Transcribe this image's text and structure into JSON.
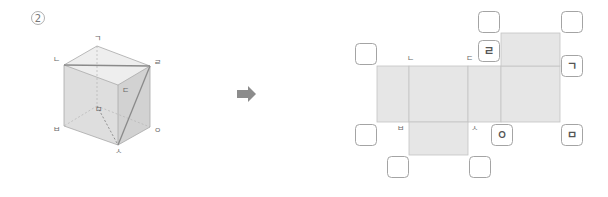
{
  "problem": {
    "number_label": "2"
  },
  "colors": {
    "top_face": "#eeeeee",
    "front_face": "#dedede",
    "right_face": "#d2d2d2",
    "edge": "#a8a8a8",
    "diag": "#8a8a8a",
    "net_fill": "#e6e6e6",
    "net_line": "#c4c4c4",
    "box_border": "#9a9a9a",
    "arrow": "#8c8c8c"
  },
  "cube": {
    "vertices": {
      "g": {
        "label": "ㄱ",
        "x": 97,
        "y": 46
      },
      "n": {
        "label": "ㄴ",
        "x": 64,
        "y": 65
      },
      "r": {
        "label": "ㄹ",
        "x": 150,
        "y": 66
      },
      "d": {
        "label": "ㄷ",
        "x": 118,
        "y": 85
      },
      "m": {
        "label": "ㅁ",
        "x": 97,
        "y": 106
      },
      "b": {
        "label": "ㅂ",
        "x": 64,
        "y": 126
      },
      "o": {
        "label": "ㅇ",
        "x": 150,
        "y": 127
      },
      "s": {
        "label": "ㅅ",
        "x": 118,
        "y": 145
      }
    },
    "labels": [
      {
        "text": "ㄱ",
        "x": 97,
        "y": 41
      },
      {
        "text": "ㄴ",
        "x": 56,
        "y": 62
      },
      {
        "text": "ㄹ",
        "x": 157,
        "y": 65
      },
      {
        "text": "ㄷ",
        "x": 125,
        "y": 93
      },
      {
        "text": "ㅁ",
        "x": 98,
        "y": 112
      },
      {
        "text": "ㅂ",
        "x": 56,
        "y": 132
      },
      {
        "text": "ㅇ",
        "x": 157,
        "y": 133
      },
      {
        "text": "ㅅ",
        "x": 118,
        "y": 154
      }
    ]
  },
  "arrow": {
    "direction": "right",
    "x": 237,
    "y": 94
  },
  "net": {
    "faces": [
      {
        "name": "left-face",
        "x": 377,
        "y": 66,
        "w": 32,
        "h": 56
      },
      {
        "name": "front-face",
        "x": 409,
        "y": 66,
        "w": 59,
        "h": 56
      },
      {
        "name": "right-face",
        "x": 468,
        "y": 66,
        "w": 33,
        "h": 56
      },
      {
        "name": "back-face",
        "x": 501,
        "y": 66,
        "w": 59,
        "h": 56
      },
      {
        "name": "top-face",
        "x": 501,
        "y": 33,
        "w": 59,
        "h": 33
      },
      {
        "name": "bottom-face",
        "x": 409,
        "y": 122,
        "w": 59,
        "h": 33
      }
    ],
    "vertex_labels": [
      {
        "text": "ㄴ",
        "x": 410,
        "y": 61
      },
      {
        "text": "ㄷ",
        "x": 469,
        "y": 61
      },
      {
        "text": "ㅂ",
        "x": 400,
        "y": 131
      },
      {
        "text": "ㅅ",
        "x": 474,
        "y": 131
      }
    ],
    "answer_boxes": [
      {
        "id": "box-top-left",
        "x": 355,
        "y": 43,
        "value": ""
      },
      {
        "id": "box-upper-mid",
        "x": 478,
        "y": 11,
        "value": ""
      },
      {
        "id": "box-r",
        "x": 478,
        "y": 40,
        "value": "ㄹ"
      },
      {
        "id": "box-top-right",
        "x": 561,
        "y": 11,
        "value": ""
      },
      {
        "id": "box-g",
        "x": 561,
        "y": 55,
        "value": "ㄱ"
      },
      {
        "id": "box-bottom-left",
        "x": 355,
        "y": 124,
        "value": ""
      },
      {
        "id": "box-o",
        "x": 491,
        "y": 124,
        "value": "ㅇ"
      },
      {
        "id": "box-m",
        "x": 561,
        "y": 124,
        "value": "ㅁ"
      },
      {
        "id": "box-bottom-sq-left",
        "x": 387,
        "y": 156,
        "value": ""
      },
      {
        "id": "box-bottom-sq-right",
        "x": 469,
        "y": 156,
        "value": ""
      }
    ],
    "box_size": 21
  }
}
